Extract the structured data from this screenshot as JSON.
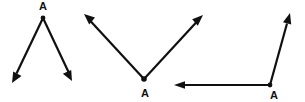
{
  "figure": {
    "background_color": "#ffffff",
    "stroke_color": "#101010",
    "width": 305,
    "height": 102,
    "angles": [
      {
        "id": "angle-1",
        "label": "A",
        "vertex_position": "top",
        "opening": "downward",
        "label_text": "A",
        "vertex": {
          "x": 43,
          "y": 18
        },
        "label_point": {
          "x": 43,
          "y": 10
        },
        "rays": [
          {
            "name": "ray-down-left",
            "tip": {
              "x": 12,
              "y": 83
            },
            "arrow": true
          },
          {
            "name": "ray-down-right",
            "tip": {
              "x": 72,
              "y": 81
            },
            "arrow": true
          }
        ]
      },
      {
        "id": "angle-2",
        "label": "A",
        "vertex_position": "bottom",
        "opening": "upward",
        "label_text": "A",
        "vertex": {
          "x": 144,
          "y": 79
        },
        "label_point": {
          "x": 145,
          "y": 97
        },
        "rays": [
          {
            "name": "ray-up-left",
            "tip": {
              "x": 84,
              "y": 14
            },
            "arrow": true
          },
          {
            "name": "ray-up-right",
            "tip": {
              "x": 203,
              "y": 15
            },
            "arrow": true
          }
        ]
      },
      {
        "id": "angle-3",
        "label": "A",
        "vertex_position": "bottom-right",
        "opening": "upper-left",
        "label_text": "A",
        "vertex": {
          "x": 270,
          "y": 85
        },
        "label_point": {
          "x": 274,
          "y": 99
        },
        "rays": [
          {
            "name": "ray-left-horizontal",
            "tip": {
              "x": 174,
              "y": 85
            },
            "arrow": true
          },
          {
            "name": "ray-up",
            "tip": {
              "x": 290,
              "y": 13
            },
            "arrow": true
          }
        ]
      }
    ]
  }
}
